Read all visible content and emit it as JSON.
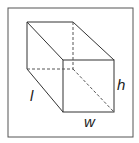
{
  "diagram": {
    "labels": {
      "length": "l",
      "width": "w",
      "height": "h"
    },
    "colors": {
      "line": "#333333",
      "frame": "#555555",
      "background": "#ffffff"
    }
  }
}
